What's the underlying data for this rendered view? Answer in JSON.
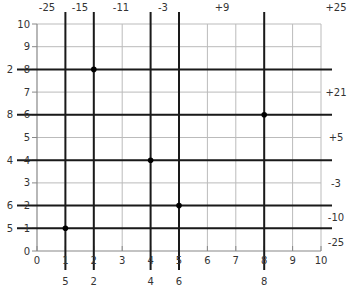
{
  "diagram": {
    "type": "grid-permutation-diagram",
    "x_axis": {
      "min": 0,
      "max": 10,
      "ticks": [
        "0",
        "1",
        "2",
        "3",
        "4",
        "5",
        "6",
        "7",
        "8",
        "9",
        "10"
      ]
    },
    "y_axis": {
      "min": 0,
      "max": 10,
      "ticks": [
        "0",
        "1",
        "2",
        "3",
        "4",
        "5",
        "6",
        "7",
        "8",
        "9",
        "10"
      ]
    },
    "points": [
      {
        "x": 2,
        "y": 8
      },
      {
        "x": 8,
        "y": 6
      },
      {
        "x": 4,
        "y": 4
      },
      {
        "x": 5,
        "y": 2
      },
      {
        "x": 1,
        "y": 1
      }
    ],
    "bold_vertical_lines": [
      {
        "x": 1,
        "bottom_label": "5"
      },
      {
        "x": 2,
        "bottom_label": "2"
      },
      {
        "x": 4,
        "bottom_label": "4"
      },
      {
        "x": 5,
        "bottom_label": "6"
      },
      {
        "x": 8,
        "bottom_label": "8"
      }
    ],
    "bold_horizontal_lines": [
      {
        "y": 8,
        "left_label": "2"
      },
      {
        "y": 6,
        "left_label": "8"
      },
      {
        "y": 4,
        "left_label": "4"
      },
      {
        "y": 2,
        "left_label": "6"
      },
      {
        "y": 1,
        "left_label": "5"
      }
    ],
    "top_labels": [
      {
        "text": "-25",
        "px": 47
      },
      {
        "text": "-15",
        "px": 80
      },
      {
        "text": "-11",
        "px": 121
      },
      {
        "text": "-3",
        "px": 163
      },
      {
        "text": "+9",
        "px": 222
      },
      {
        "text": "+25",
        "px": 336
      }
    ],
    "right_labels": [
      {
        "text": "+21",
        "py": 96
      },
      {
        "text": "+5",
        "py": 141
      },
      {
        "text": "-3",
        "py": 187
      },
      {
        "text": "-10",
        "py": 221
      },
      {
        "text": "-25",
        "py": 246
      }
    ],
    "colors": {
      "grid": "#bbbbbb",
      "axis": "#888888",
      "bold": "#1a1a1a",
      "point": "#000000",
      "text": "#333333"
    }
  }
}
